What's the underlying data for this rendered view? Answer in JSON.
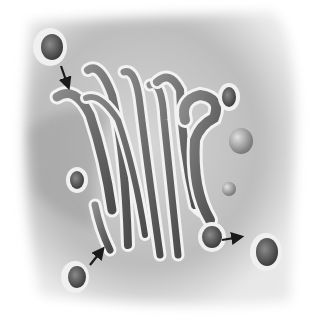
{
  "figure": {
    "style": "grayscale",
    "colors": {
      "background": "#ffffff",
      "cytoplasm": "#c8c8c8",
      "cytoplasm_dark": "#8a8a8a",
      "membrane": "#f2f2f2",
      "lumen": "#6e6e6e",
      "lumen_dark": "#4a4a4a",
      "arrow": "#1a1a1a"
    }
  },
  "elements": {
    "cisternae_count": 7,
    "vesicles": [
      {
        "name": "incoming-vesicle-top-left",
        "content": "cargo"
      },
      {
        "name": "vesicle-left-middle",
        "content": "cargo"
      },
      {
        "name": "incoming-vesicle-bottom-left",
        "content": "cargo"
      },
      {
        "name": "vesicle-top-right",
        "content": "cargo"
      },
      {
        "name": "vesicle-right-small",
        "content": "empty"
      },
      {
        "name": "vesicle-right-tiny",
        "content": "empty"
      },
      {
        "name": "budding-vesicle",
        "content": "cargo"
      },
      {
        "name": "released-vesicle-bottom-right",
        "content": "cargo"
      }
    ],
    "arrows": [
      {
        "name": "arrow-fusion-top",
        "meaning": "vesicle fusing with cis face"
      },
      {
        "name": "arrow-fusion-bottom",
        "meaning": "vesicle fusing with cisterna"
      },
      {
        "name": "arrow-release-right",
        "meaning": "vesicle budding from trans face"
      }
    ]
  }
}
